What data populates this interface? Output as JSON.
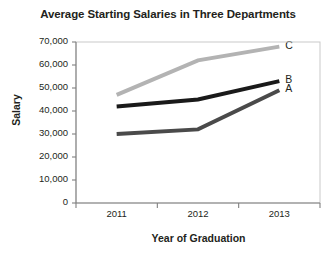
{
  "chart_data": {
    "type": "line",
    "title": "Average Starting Salaries in Three Departments",
    "xlabel": "Year of Graduation",
    "ylabel": "Salary",
    "categories": [
      "2011",
      "2012",
      "2013"
    ],
    "x": [
      2011,
      2012,
      2013
    ],
    "series": [
      {
        "name": "A",
        "values": [
          30000,
          32000,
          49000
        ],
        "color": "#4a4a4a"
      },
      {
        "name": "B",
        "values": [
          42000,
          45000,
          53000
        ],
        "color": "#1a1a1a"
      },
      {
        "name": "C",
        "values": [
          47000,
          62000,
          68000
        ],
        "color": "#b3b3b3"
      }
    ],
    "ylim": [
      0,
      70000
    ],
    "yticks": [
      0,
      10000,
      20000,
      30000,
      40000,
      50000,
      60000,
      70000
    ],
    "ytick_labels": [
      "0",
      "10,000",
      "20,000",
      "30,000",
      "40,000",
      "50,000",
      "60,000",
      "70,000"
    ],
    "grid": false,
    "legend": "series-end-labels",
    "axis_color": "#808080",
    "text_color": "#231f20",
    "background": "#ffffff"
  }
}
